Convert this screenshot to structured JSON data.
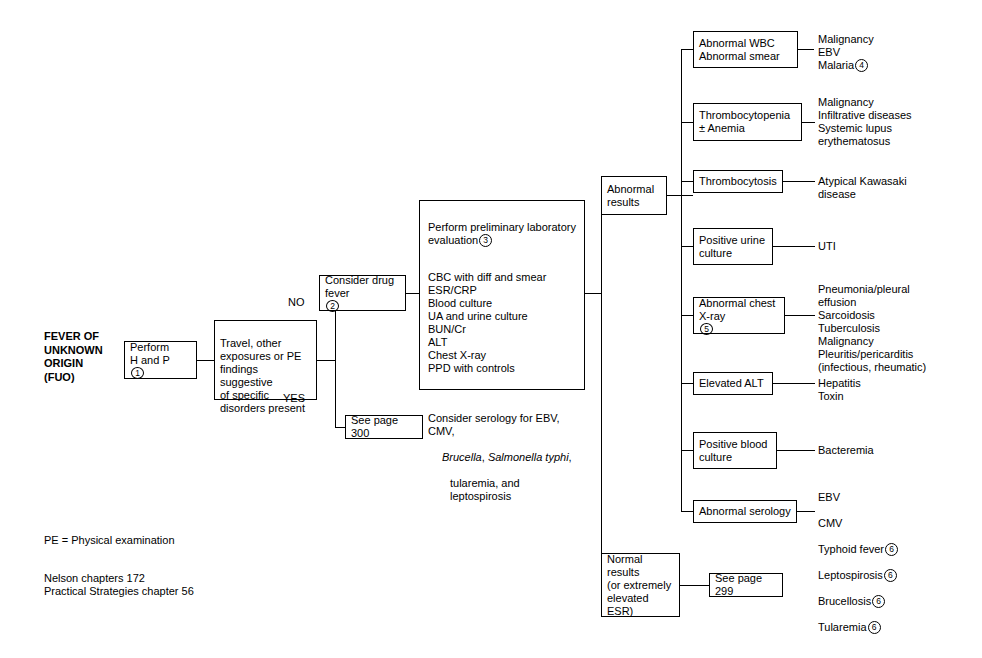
{
  "diagram": {
    "title": "FEVER OF\nUNKNOWN\nORIGIN\n(FUO)",
    "boxes": {
      "perform_hp": "Perform\nH and P",
      "perform_hp_note": "1",
      "travel": "Travel, other\nexposures or PE\nfindings suggestive\nof specific\ndisorders present",
      "drug_fever": "Consider drug\nfever",
      "drug_fever_note": "2",
      "see_page_300": "See page 300",
      "lab_heading": "Perform preliminary laboratory\n    evaluation",
      "lab_heading_note": "3",
      "lab_tests": "CBC with diff and smear\nESR/CRP\nBlood culture\nUA and urine culture\nBUN/Cr\nALT\nChest X-ray\nPPD with controls",
      "lab_serology_line1": "Consider serology for EBV, CMV,",
      "lab_serology_brucella": "Brucella",
      "lab_serology_comma1": ", ",
      "lab_serology_salmonella": "Salmonella typhi",
      "lab_serology_comma2": ",",
      "lab_serology_line3": "tularemia, and leptospirosis",
      "abnormal_results": "Abnormal\nresults",
      "normal_results": "Normal\nresults\n(or extremely\nelevated ESR)",
      "see_page_299": "See page 299",
      "abnormal_wbc": "Abnormal WBC\nAbnormal smear",
      "thrombocytopenia": "Thrombocytopenia\n± Anemia",
      "thrombocytosis": "Thrombocytosis",
      "positive_urine": "Positive urine\nculture",
      "abnormal_chest": "Abnormal chest\nX-ray",
      "abnormal_chest_note": "5",
      "elevated_alt": "Elevated ALT",
      "positive_blood": "Positive blood\nculture",
      "abnormal_serology": "Abnormal serology"
    },
    "edge_labels": {
      "no": "NO",
      "yes": "YES"
    },
    "outcomes": {
      "abnormal_wbc": {
        "lines": "Malignancy\nEBV\nMalaria",
        "note": "4"
      },
      "thrombocytopenia": {
        "lines": "Malignancy\nInfiltrative diseases\nSystemic lupus\n    erythematosus"
      },
      "thrombocytosis": {
        "lines": "Atypical Kawasaki\n    disease"
      },
      "positive_urine": {
        "lines": "UTI"
      },
      "abnormal_chest": {
        "lines": "Pneumonia/pleural\n    effusion\nSarcoidosis\nTuberculosis\nMalignancy\nPleuritis/pericarditis\n    (infectious, rheumatic)"
      },
      "elevated_alt": {
        "lines": "Hepatitis\nToxin"
      },
      "positive_blood": {
        "lines": "Bacteremia"
      },
      "abnormal_serology": {
        "line1": "EBV",
        "line2": "CMV",
        "line3": "Typhoid fever",
        "line3_note": "6",
        "line4": "Leptospirosis",
        "line4_note": "6",
        "line5": "Brucellosis",
        "line5_note": "6",
        "line6": "Tularemia",
        "line6_note": "6"
      }
    },
    "footnotes": {
      "abbreviation": "PE = Physical examination",
      "references": "Nelson chapters 172\nPractical Strategies chapter 56"
    }
  }
}
